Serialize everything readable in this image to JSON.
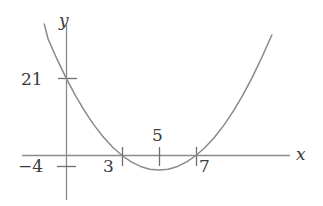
{
  "figure": {
    "background_color": "#ffffff",
    "stroke_color": "#8a8a8a",
    "text_color": "#3a3a3a"
  },
  "labels": {
    "y_intercept": "21",
    "x_neg4": "−4",
    "x_3": "3",
    "x_5": "5",
    "x_7": "7",
    "axis_x": "x",
    "axis_y": "y"
  },
  "chart_data": {
    "type": "line",
    "title": "",
    "subtitle": "",
    "xlabel": "x",
    "ylabel": "y",
    "grid": false,
    "legend": null,
    "curve": {
      "name": "parabola",
      "equation": "y = (x - 3)(x - 7) = x^2 - 10x + 21",
      "orientation": "opens upward",
      "roots": [
        3,
        7
      ],
      "vertex": {
        "x": 5,
        "y": -4
      },
      "y_intercept": 21,
      "x_drawn_range": [
        -1.2,
        11.1
      ],
      "points": [
        {
          "x": -1.2,
          "y": 36.0
        },
        {
          "x": -1.0,
          "y": 32.0
        },
        {
          "x": -0.5,
          "y": 26.25
        },
        {
          "x": 0.0,
          "y": 21.0
        },
        {
          "x": 0.5,
          "y": 16.25
        },
        {
          "x": 1.0,
          "y": 12.0
        },
        {
          "x": 1.5,
          "y": 8.25
        },
        {
          "x": 2.0,
          "y": 5.0
        },
        {
          "x": 2.5,
          "y": 2.25
        },
        {
          "x": 3.0,
          "y": 0.0
        },
        {
          "x": 3.5,
          "y": -1.75
        },
        {
          "x": 4.0,
          "y": -3.0
        },
        {
          "x": 4.5,
          "y": -3.75
        },
        {
          "x": 5.0,
          "y": -4.0
        },
        {
          "x": 5.5,
          "y": -3.75
        },
        {
          "x": 6.0,
          "y": -3.0
        },
        {
          "x": 6.5,
          "y": -1.75
        },
        {
          "x": 7.0,
          "y": 0.0
        },
        {
          "x": 7.5,
          "y": 2.25
        },
        {
          "x": 8.0,
          "y": 5.0
        },
        {
          "x": 8.5,
          "y": 8.25
        },
        {
          "x": 9.0,
          "y": 12.0
        },
        {
          "x": 9.5,
          "y": 16.25
        },
        {
          "x": 10.0,
          "y": 21.0
        },
        {
          "x": 10.5,
          "y": 26.25
        },
        {
          "x": 11.1,
          "y": 33.0
        }
      ]
    },
    "x_axis": {
      "drawn_range": [
        -4.8,
        12.2
      ],
      "ticks": [
        {
          "value": -4,
          "label": "−4",
          "label_position": "below-axis"
        },
        {
          "value": 3,
          "label": "3",
          "label_position": "below-axis"
        },
        {
          "value": 5,
          "label": "5",
          "label_position": "above-axis"
        },
        {
          "value": 7,
          "label": "7",
          "label_position": "below-axis"
        }
      ]
    },
    "y_axis": {
      "drawn_range": [
        -11,
        37
      ],
      "ticks": [
        {
          "value": 21,
          "label": "21",
          "label_position": "left-of-axis"
        }
      ]
    },
    "annotations": [
      "Parabola crosses the x-axis at x = 3 and x = 7.",
      "Vertex (minimum) located at x = 5.",
      "Curve crosses the y-axis at y = 21."
    ]
  }
}
